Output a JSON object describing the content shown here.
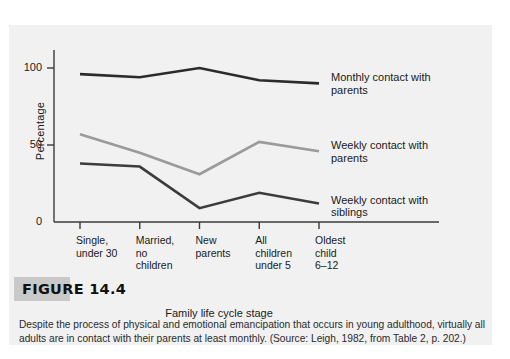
{
  "figure": {
    "tab_label": "FIGURE 14.4",
    "caption": "Despite the process of physical and emotional emancipation that occurs in young adulthood, virtually all adults are in contact with their parents at least monthly. (Source: Leigh, 1982, from Table 2, p. 202.)"
  },
  "colors": {
    "panel_background": "#f1f1f1",
    "page_background": "#ffffff",
    "axis": "#3a3a3a",
    "text": "#1a1a1a",
    "series_monthly_parents": "#2b2b2b",
    "series_weekly_parents": "#9a9a9a",
    "series_weekly_siblings": "#3c3c3c",
    "tab_shadow": "#c9c9c9"
  },
  "chart_data": {
    "type": "line",
    "title": "",
    "xlabel": "Family life cycle stage",
    "ylabel": "Percentage",
    "categories": [
      "Single, under 30",
      "Married, no children",
      "New parents",
      "All children under 5",
      "Oldest child 6–12"
    ],
    "category_lines": [
      [
        "Single,",
        "under 30"
      ],
      [
        "Married,",
        "no",
        "children"
      ],
      [
        "New",
        "parents"
      ],
      [
        "All",
        "children",
        "under 5"
      ],
      [
        "Oldest",
        "child",
        "6–12"
      ]
    ],
    "ylim": [
      0,
      100
    ],
    "yticks": [
      0,
      50,
      100
    ],
    "ytick_labels": [
      "0",
      "50",
      "100"
    ],
    "grid": false,
    "legend_position": "right-of-line-ends",
    "series": [
      {
        "name": "Monthly contact with parents",
        "label_lines": [
          "Monthly contact with",
          "parents"
        ],
        "color": "#2b2b2b",
        "values": [
          96,
          94,
          100,
          92,
          90
        ]
      },
      {
        "name": "Weekly contact with parents",
        "label_lines": [
          "Weekly contact with",
          "parents"
        ],
        "color": "#9a9a9a",
        "values": [
          57,
          45,
          31,
          52,
          46
        ]
      },
      {
        "name": "Weekly contact with siblings",
        "label_lines": [
          "Weekly contact with",
          "siblings"
        ],
        "color": "#3c3c3c",
        "values": [
          38,
          36,
          9,
          19,
          12
        ]
      }
    ]
  }
}
